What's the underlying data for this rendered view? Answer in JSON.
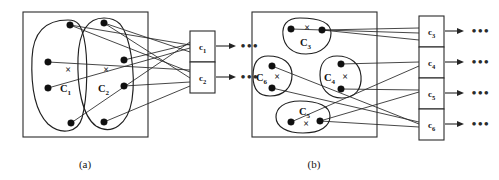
{
  "figure": {
    "type": "bipartite-clustering-diagram",
    "caption_a": "(a)",
    "caption_b": "(b)",
    "centroid_mark": "×",
    "continuation_dots": "•••",
    "colors": {
      "stroke": "#262626",
      "node_fill": "#101010",
      "frame": "#2b2b2b",
      "background": "#ffffff"
    }
  },
  "panel_a": {
    "caption": "(a)",
    "clusters": [
      {
        "id": "C1",
        "label_base": "C",
        "label_sub": "1",
        "centroid": "×",
        "nodes": 4
      },
      {
        "id": "C2",
        "label_base": "C",
        "label_sub": "2",
        "centroid": "×",
        "nodes": 4
      }
    ],
    "boxes": [
      {
        "id": "c1",
        "label_base": "c",
        "label_sub": "1",
        "trailing_dots": "•••"
      },
      {
        "id": "c2",
        "label_base": "c",
        "label_sub": "2",
        "trailing_dots": "•••"
      }
    ],
    "separator_dots": "•••"
  },
  "panel_b": {
    "caption": "(b)",
    "clusters": [
      {
        "id": "C3",
        "label_base": "C",
        "label_sub": "3",
        "centroid": "×",
        "nodes": 2
      },
      {
        "id": "C6",
        "label_base": "C",
        "label_sub": "6",
        "centroid": "×",
        "nodes": 2
      },
      {
        "id": "C4",
        "label_base": "C",
        "label_sub": "4",
        "centroid": "×",
        "nodes": 2
      },
      {
        "id": "C5",
        "label_base": "C",
        "label_sub": "5",
        "centroid": "×",
        "nodes": 2
      }
    ],
    "boxes": [
      {
        "id": "c3",
        "label_base": "c",
        "label_sub": "3",
        "trailing_dots": "•••"
      },
      {
        "id": "c4",
        "label_base": "c",
        "label_sub": "4",
        "trailing_dots": "•••"
      },
      {
        "id": "c5",
        "label_base": "c",
        "label_sub": "5",
        "trailing_dots": "•••"
      },
      {
        "id": "c6",
        "label_base": "c",
        "label_sub": "6",
        "trailing_dots": "•••"
      }
    ]
  }
}
